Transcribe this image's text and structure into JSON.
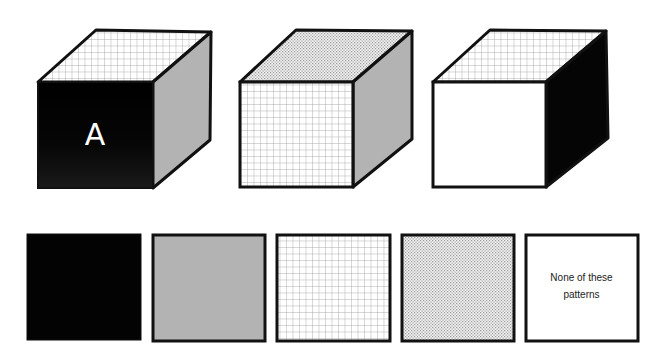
{
  "puzzle": {
    "cubes": [
      {
        "id": "cube-1",
        "faces": {
          "top": "grid",
          "front": "black",
          "right": "gray"
        },
        "front_label": "A"
      },
      {
        "id": "cube-2",
        "faces": {
          "top": "dotted",
          "front": "grid",
          "right": "gray"
        },
        "front_label": ""
      },
      {
        "id": "cube-3",
        "faces": {
          "top": "grid",
          "front": "white",
          "right": "black"
        },
        "front_label": ""
      }
    ],
    "options": [
      {
        "id": "option-black",
        "pattern": "black",
        "label": ""
      },
      {
        "id": "option-gray",
        "pattern": "gray",
        "label": ""
      },
      {
        "id": "option-grid",
        "pattern": "grid",
        "label": ""
      },
      {
        "id": "option-dotted",
        "pattern": "dotted",
        "label": ""
      },
      {
        "id": "option-none",
        "pattern": "white",
        "label_line1": "None of these",
        "label_line2": "patterns"
      }
    ]
  },
  "colors": {
    "black": "#050505",
    "gray": "#b3b3b3",
    "white": "#ffffff",
    "outline": "#111111",
    "grid_line": "#a8a8a8",
    "dot": "#9a9a9a"
  }
}
